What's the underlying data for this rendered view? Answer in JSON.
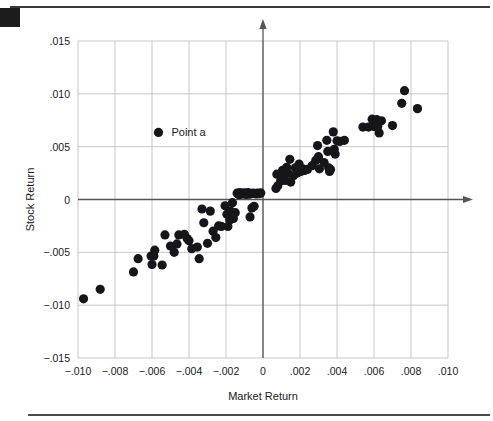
{
  "figure": {
    "corner_marker": "black-square-bullet",
    "top_rule": "horizontal-rule",
    "bottom_rule": "horizontal-rule"
  },
  "legend": {
    "label": "Point a",
    "marker": "filled-circle",
    "x": -0.00565,
    "y": 0.00635
  },
  "chart_data": {
    "type": "scatter",
    "title": "",
    "xlabel": "Market Return",
    "ylabel": "Stock Return",
    "xlim": [
      -0.01,
      0.01
    ],
    "ylim": [
      -0.015,
      0.015
    ],
    "xticks": [
      -0.01,
      -0.008,
      -0.006,
      -0.004,
      -0.002,
      0,
      0.002,
      0.004,
      0.006,
      0.008,
      0.01
    ],
    "yticks": [
      0.015,
      0.01,
      0.005,
      0,
      -0.005,
      -0.01,
      -0.015
    ],
    "xticklabels": [
      "−.010",
      "−.008",
      "−.006",
      "−.004",
      "−.002",
      "0",
      ".002",
      ".004",
      ".006",
      ".008",
      ".010"
    ],
    "yticklabels": [
      ".015",
      ".010",
      ".005",
      "0",
      "−.005",
      "−.010",
      "−.015"
    ],
    "grid": true,
    "legend": [
      "Point a"
    ],
    "legend_position": "upper-left-inside",
    "marker_color": "#16161a",
    "marker_size": 4.6,
    "series": [
      {
        "name": "Point a",
        "points": [
          [
            -0.0097,
            -0.0094
          ],
          [
            -0.0088,
            -0.0085
          ],
          [
            -0.007,
            -0.00685
          ],
          [
            -0.00675,
            -0.0056
          ],
          [
            -0.00605,
            -0.00535
          ],
          [
            -0.0059,
            -0.00535
          ],
          [
            -0.006,
            -0.00615
          ],
          [
            -0.00585,
            -0.0048
          ],
          [
            -0.00545,
            -0.0062
          ],
          [
            -0.0053,
            -0.00335
          ],
          [
            -0.005,
            -0.0044
          ],
          [
            -0.0048,
            -0.005
          ],
          [
            -0.00465,
            -0.0042
          ],
          [
            -0.00455,
            -0.00335
          ],
          [
            -0.00425,
            -0.0033
          ],
          [
            -0.0041,
            -0.0037
          ],
          [
            -0.004,
            -0.0039
          ],
          [
            -0.00385,
            -0.00465
          ],
          [
            -0.00355,
            -0.0045
          ],
          [
            -0.00345,
            -0.0056
          ],
          [
            -0.0033,
            -0.0009
          ],
          [
            -0.0032,
            -0.0022
          ],
          [
            -0.003,
            -0.00415
          ],
          [
            -0.00285,
            -0.0011
          ],
          [
            -0.0027,
            -0.003
          ],
          [
            -0.00255,
            -0.0036
          ],
          [
            -0.0024,
            -0.0025
          ],
          [
            -0.00225,
            -0.00255
          ],
          [
            -0.00205,
            -0.0006
          ],
          [
            -0.00195,
            -0.0014
          ],
          [
            -0.0019,
            -0.00255
          ],
          [
            -0.0018,
            -0.00195
          ],
          [
            -0.00175,
            -0.0011
          ],
          [
            -0.00165,
            -0.0003
          ],
          [
            -0.0016,
            -0.0018
          ],
          [
            -0.0015,
            -0.00125
          ],
          [
            -0.0014,
            0.0006
          ],
          [
            -0.0013,
            0.00045
          ],
          [
            -0.00125,
            0.00065
          ],
          [
            -0.00118,
            0.0005
          ],
          [
            -0.0011,
            0.0006
          ],
          [
            -0.00105,
            0.00055
          ],
          [
            -0.00098,
            0.00062
          ],
          [
            -0.00092,
            0.00048
          ],
          [
            -0.00086,
            0.00058
          ],
          [
            -0.0008,
            0.00065
          ],
          [
            -0.00075,
            0.0005
          ],
          [
            -0.0007,
            -0.00165
          ],
          [
            -0.00065,
            0.00055
          ],
          [
            -0.0006,
            -0.0008
          ],
          [
            -0.00055,
            0.0006
          ],
          [
            -0.00048,
            -0.00065
          ],
          [
            -0.00042,
            0.00058
          ],
          [
            -0.00036,
            0.00052
          ],
          [
            -0.00028,
            0.0006
          ],
          [
            -0.0002,
            0.00055
          ],
          [
            -0.00012,
            0.00062
          ],
          [
            0.0007,
            0.00105
          ],
          [
            0.00075,
            0.0024
          ],
          [
            0.0008,
            0.0013
          ],
          [
            0.00095,
            0.00175
          ],
          [
            0.00105,
            0.00275
          ],
          [
            0.0011,
            0.00215
          ],
          [
            0.0012,
            0.0018
          ],
          [
            0.00128,
            0.00305
          ],
          [
            0.00135,
            0.0025
          ],
          [
            0.00145,
            0.0038
          ],
          [
            0.0015,
            0.00165
          ],
          [
            0.00165,
            0.00225
          ],
          [
            0.00175,
            0.003
          ],
          [
            0.00185,
            0.0025
          ],
          [
            0.00195,
            0.00335
          ],
          [
            0.00205,
            0.00265
          ],
          [
            0.00215,
            0.0029
          ],
          [
            0.00225,
            0.00275
          ],
          [
            0.0024,
            0.00285
          ],
          [
            0.00265,
            0.0032
          ],
          [
            0.00285,
            0.0037
          ],
          [
            0.00295,
            0.0051
          ],
          [
            0.003,
            0.00405
          ],
          [
            0.00305,
            0.0029
          ],
          [
            0.0033,
            0.0035
          ],
          [
            0.00345,
            0.0056
          ],
          [
            0.0035,
            0.00455
          ],
          [
            0.00355,
            0.003
          ],
          [
            0.0036,
            0.00265
          ],
          [
            0.00365,
            0.00285
          ],
          [
            0.0038,
            0.0064
          ],
          [
            0.00385,
            0.00475
          ],
          [
            0.0039,
            0.0043
          ],
          [
            0.004,
            0.00555
          ],
          [
            0.00415,
            0.0055
          ],
          [
            0.0044,
            0.0056
          ],
          [
            0.0054,
            0.00685
          ],
          [
            0.0057,
            0.00685
          ],
          [
            0.0059,
            0.0076
          ],
          [
            0.006,
            0.0069
          ],
          [
            0.0061,
            0.007
          ],
          [
            0.00615,
            0.00755
          ],
          [
            0.0062,
            0.0069
          ],
          [
            0.00628,
            0.0063
          ],
          [
            0.0064,
            0.00745
          ],
          [
            0.007,
            0.007
          ],
          [
            0.0075,
            0.0091
          ],
          [
            0.00765,
            0.0103
          ],
          [
            0.00835,
            0.0086
          ]
        ]
      }
    ]
  }
}
